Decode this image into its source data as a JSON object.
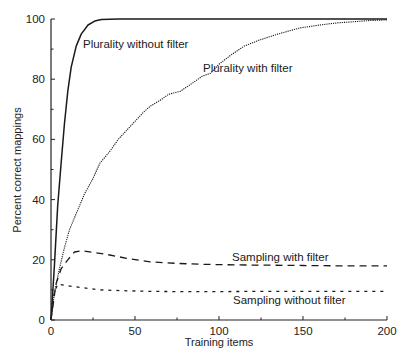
{
  "chart_data": {
    "type": "line",
    "title": "",
    "xlabel": "Training items",
    "ylabel": "Percent correct mappings",
    "xlim": [
      0,
      200
    ],
    "ylim": [
      0,
      100
    ],
    "x_ticks": [
      0,
      50,
      100,
      150,
      200
    ],
    "x_minor_ticks": [
      25,
      75,
      125,
      175
    ],
    "y_ticks": [
      0,
      20,
      40,
      60,
      80,
      100
    ],
    "y_minor_ticks": [
      10,
      30,
      50,
      70,
      90
    ],
    "grid": false,
    "legend": "inline labels",
    "series": [
      {
        "name": "Plurality without filter",
        "style": "solid",
        "x": [
          0,
          2,
          4,
          6,
          8,
          10,
          12,
          15,
          18,
          22,
          26,
          30,
          40,
          60,
          100,
          150,
          200
        ],
        "y": [
          0,
          18,
          38,
          52,
          65,
          76,
          84,
          91,
          95,
          98,
          99.3,
          99.8,
          100,
          100,
          100,
          100,
          100
        ],
        "label_pos": {
          "x": 83,
          "y": 48
        }
      },
      {
        "name": "Plurality with filter",
        "style": "dotted",
        "x": [
          0,
          2,
          5,
          8,
          11,
          14,
          17,
          20,
          25,
          29,
          35,
          40,
          45,
          50,
          55,
          59,
          65,
          70,
          77,
          85,
          90,
          95,
          100,
          107,
          115,
          124,
          135,
          148,
          160,
          170,
          178,
          190,
          200
        ],
        "y": [
          0,
          9,
          17,
          24,
          30,
          34,
          38,
          42,
          47,
          52,
          56,
          60,
          63,
          66,
          69,
          71,
          73,
          75,
          76,
          79,
          81,
          82,
          85,
          88,
          91,
          93,
          95,
          97,
          98,
          98.7,
          99,
          99.5,
          99.7
        ],
        "label_pos": {
          "x": 203,
          "y": 72
        }
      },
      {
        "name": "Sampling with filter",
        "style": "dashed",
        "x": [
          0,
          3,
          6,
          10,
          14,
          18,
          25,
          35,
          45,
          59,
          75,
          90,
          110,
          130,
          150,
          170,
          200
        ],
        "y": [
          0,
          12,
          17,
          20,
          22.6,
          23,
          22.5,
          21.6,
          20.5,
          19.3,
          18.8,
          18.5,
          18.3,
          18.2,
          18.1,
          18.0,
          18.0
        ],
        "label_pos": {
          "x": 232,
          "y": 261
        }
      },
      {
        "name": "Sampling without filter",
        "style": "dotted-short",
        "x": [
          0,
          2,
          4,
          8,
          15,
          29,
          45,
          60,
          89,
          120,
          150,
          200
        ],
        "y": [
          0,
          9,
          12,
          11.5,
          11,
          10,
          9.7,
          9.5,
          9.4,
          9.5,
          9.5,
          9.5
        ],
        "label_pos": {
          "x": 233,
          "y": 304
        }
      }
    ]
  },
  "axes": {
    "x_title": "Training items",
    "y_title": "Percent correct mappings"
  }
}
